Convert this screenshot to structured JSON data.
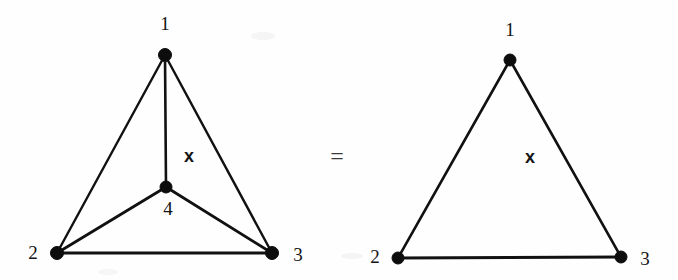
{
  "figure": {
    "background_color": "#fefefe",
    "ink_color": "#111111",
    "width": 678,
    "height": 280,
    "relation_symbol": "=",
    "panels": [
      {
        "id": "left-panel",
        "name": "planar-k4-graph",
        "vertices": [
          {
            "id": "v1",
            "label": "1",
            "cx": 165,
            "cy": 55,
            "r": 6.5,
            "label_x": 165,
            "label_y": 26
          },
          {
            "id": "v2",
            "label": "2",
            "cx": 57,
            "cy": 253,
            "r": 6.5,
            "label_x": 33,
            "label_y": 255
          },
          {
            "id": "v3",
            "label": "3",
            "cx": 272,
            "cy": 253,
            "r": 6.5,
            "label_x": 298,
            "label_y": 257
          },
          {
            "id": "v4",
            "label": "4",
            "cx": 166,
            "cy": 187,
            "r": 6.0,
            "label_x": 168,
            "label_y": 211
          }
        ],
        "edges": [
          {
            "id": "e12",
            "from": "v1",
            "to": "v2",
            "x1": 165,
            "y1": 55,
            "x2": 57,
            "y2": 253,
            "width": 2.4
          },
          {
            "id": "e13",
            "from": "v1",
            "to": "v3",
            "x1": 165,
            "y1": 55,
            "x2": 272,
            "y2": 253,
            "width": 2.4
          },
          {
            "id": "e14",
            "from": "v1",
            "to": "v4",
            "x1": 165,
            "y1": 55,
            "x2": 166,
            "y2": 187,
            "width": 2.6
          },
          {
            "id": "e23",
            "from": "v2",
            "to": "v3",
            "x1": 57,
            "y1": 253,
            "x2": 272,
            "y2": 253,
            "width": 3.0
          },
          {
            "id": "e24",
            "from": "v2",
            "to": "v4",
            "x1": 57,
            "y1": 253,
            "x2": 166,
            "y2": 187,
            "width": 2.8
          },
          {
            "id": "e34",
            "from": "v3",
            "to": "v4",
            "x1": 272,
            "y1": 253,
            "x2": 166,
            "y2": 187,
            "width": 2.8
          }
        ],
        "face_labels": [
          {
            "id": "left-face-x",
            "label": "x",
            "x": 189,
            "y": 157
          }
        ]
      },
      {
        "id": "right-panel",
        "name": "triangle-graph",
        "vertices": [
          {
            "id": "v1",
            "label": "1",
            "cx": 510,
            "cy": 60,
            "r": 6.0,
            "label_x": 510,
            "label_y": 32
          },
          {
            "id": "v2",
            "label": "2",
            "cx": 398,
            "cy": 258,
            "r": 6.0,
            "label_x": 375,
            "label_y": 259
          },
          {
            "id": "v3",
            "label": "3",
            "cx": 621,
            "cy": 257,
            "r": 6.0,
            "label_x": 645,
            "label_y": 261
          }
        ],
        "edges": [
          {
            "id": "e12",
            "from": "v1",
            "to": "v2",
            "x1": 510,
            "y1": 60,
            "x2": 398,
            "y2": 258,
            "width": 2.6
          },
          {
            "id": "e13",
            "from": "v1",
            "to": "v3",
            "x1": 510,
            "y1": 60,
            "x2": 621,
            "y2": 257,
            "width": 2.6
          },
          {
            "id": "e23",
            "from": "v2",
            "to": "v3",
            "x1": 398,
            "y1": 258,
            "x2": 621,
            "y2": 257,
            "width": 3.0
          }
        ],
        "face_labels": [
          {
            "id": "right-face-x",
            "label": "x",
            "x": 530,
            "y": 158
          }
        ]
      }
    ],
    "relation": {
      "id": "equals",
      "symbol": "=",
      "x": 337,
      "y": 158
    }
  }
}
